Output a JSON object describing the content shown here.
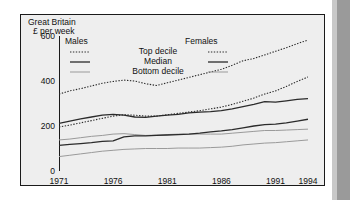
{
  "figure": {
    "region_label": "Great Britain",
    "units_label": "£ per week"
  },
  "legend": {
    "males_label": "Males",
    "females_label": "Females",
    "rows": [
      {
        "label": "Top decile",
        "style": "dotted"
      },
      {
        "label": "Median",
        "style": "solid-dark"
      },
      {
        "label": "Bottom decile",
        "style": "solid-light"
      }
    ]
  },
  "chart_data": {
    "type": "line",
    "title": "Great Britain",
    "xlabel": "",
    "ylabel": "£ per week",
    "xlim": [
      1971,
      1994
    ],
    "ylim": [
      0,
      600
    ],
    "yticks": [
      0,
      200,
      400,
      600
    ],
    "xticks": [
      1971,
      1976,
      1981,
      1986,
      1991,
      1994
    ],
    "grid": false,
    "legend_position": "top-left-inside",
    "x": [
      1971,
      1972,
      1973,
      1974,
      1975,
      1976,
      1977,
      1978,
      1979,
      1980,
      1981,
      1982,
      1983,
      1984,
      1985,
      1986,
      1987,
      1988,
      1989,
      1990,
      1991,
      1992,
      1993,
      1994
    ],
    "series": [
      {
        "name": "Males top decile",
        "style": "dotted",
        "values": [
          342,
          356,
          366,
          378,
          390,
          398,
          404,
          400,
          388,
          380,
          392,
          404,
          416,
          428,
          440,
          452,
          470,
          490,
          500,
          516,
          532,
          548,
          566,
          582
        ]
      },
      {
        "name": "Males median",
        "style": "solid-dark",
        "values": [
          212,
          222,
          232,
          240,
          248,
          252,
          248,
          240,
          238,
          244,
          248,
          252,
          258,
          262,
          264,
          268,
          276,
          286,
          296,
          308,
          306,
          312,
          318,
          322
        ]
      },
      {
        "name": "Males bottom decile",
        "style": "solid-light",
        "values": [
          138,
          142,
          148,
          154,
          158,
          164,
          166,
          162,
          158,
          160,
          162,
          164,
          164,
          164,
          164,
          164,
          168,
          172,
          176,
          180,
          180,
          182,
          184,
          186
        ]
      },
      {
        "name": "Females top decile",
        "style": "dotted",
        "values": [
          196,
          204,
          214,
          224,
          234,
          244,
          250,
          248,
          244,
          244,
          250,
          256,
          262,
          268,
          276,
          284,
          296,
          310,
          324,
          342,
          356,
          376,
          398,
          418
        ]
      },
      {
        "name": "Females median",
        "style": "solid-dark",
        "values": [
          114,
          118,
          122,
          126,
          132,
          134,
          152,
          156,
          156,
          158,
          160,
          162,
          164,
          168,
          174,
          178,
          184,
          192,
          200,
          206,
          208,
          214,
          222,
          230
        ]
      },
      {
        "name": "Females bottom decile",
        "style": "solid-light",
        "values": [
          64,
          70,
          76,
          82,
          88,
          92,
          96,
          98,
          100,
          100,
          100,
          102,
          102,
          102,
          104,
          106,
          110,
          116,
          120,
          124,
          126,
          130,
          134,
          138
        ]
      }
    ]
  }
}
